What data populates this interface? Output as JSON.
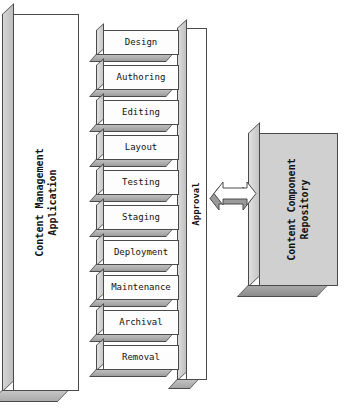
{
  "diagram": {
    "type": "block-diagram"
  },
  "application_container": {
    "label": "Content Management\nApplication",
    "label_line1": "Content Management",
    "label_line2": "Application",
    "front_color": "#ffffff",
    "edge_color": "#4a4a4a"
  },
  "pipeline": {
    "stages": [
      {
        "label": "Design"
      },
      {
        "label": "Authoring"
      },
      {
        "label": "Editing"
      },
      {
        "label": "Layout"
      },
      {
        "label": "Testing"
      },
      {
        "label": "Staging"
      },
      {
        "label": "Deployment"
      },
      {
        "label": "Maintenance"
      },
      {
        "label": "Archival"
      },
      {
        "label": "Removal"
      }
    ],
    "front_color": "#fdfdfd",
    "shadow_color": "#a8a8a8"
  },
  "approval_column": {
    "label": "Approval",
    "orientation": "vertical",
    "front_color": "#ffffff"
  },
  "connector": {
    "icon": "double-headed-arrow-icon",
    "direction": "bidirectional",
    "fill_color": "#ffffff",
    "shadow_color": "#9a9a9a"
  },
  "repository": {
    "label": "Content Component\nRepository",
    "label_line1": "Content Component",
    "label_line2": "Repository",
    "front_color": "#d0d0d0",
    "edge_color": "#4a4a4a"
  }
}
